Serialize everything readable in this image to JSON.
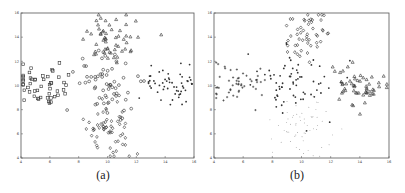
{
  "figure": {
    "captions": [
      "(a)",
      "(b)"
    ]
  },
  "chart_data": [
    {
      "type": "scatter",
      "title": "",
      "caption": "(a)",
      "xlabel": "",
      "ylabel": "",
      "xlim": [
        4,
        16
      ],
      "ylim": [
        4,
        16
      ],
      "xticks": [
        4,
        6,
        8,
        10,
        12,
        14,
        16
      ],
      "yticks": [
        4,
        6,
        8,
        10,
        12,
        14,
        16
      ],
      "grid": false,
      "legend": null,
      "series": [
        {
          "name": "left cluster",
          "marker": "square",
          "center": [
            5.5,
            10.0
          ],
          "spread": [
            1.3,
            1.0
          ],
          "count": 50,
          "seed": 11
        },
        {
          "name": "center cluster",
          "marker": "circle",
          "center": [
            10.0,
            10.2
          ],
          "spread": [
            1.4,
            1.1
          ],
          "count": 60,
          "seed": 23
        },
        {
          "name": "top cluster",
          "marker": "triangle",
          "center": [
            10.3,
            14.2
          ],
          "spread": [
            1.0,
            1.1
          ],
          "count": 55,
          "seed": 37
        },
        {
          "name": "bottom cluster",
          "marker": "diamond",
          "center": [
            10.0,
            6.6
          ],
          "spread": [
            1.0,
            1.3
          ],
          "count": 60,
          "seed": 41
        },
        {
          "name": "right cluster",
          "marker": "dot",
          "center": [
            14.4,
            10.0
          ],
          "spread": [
            1.0,
            0.9
          ],
          "count": 55,
          "seed": 53
        }
      ]
    },
    {
      "type": "scatter",
      "title": "",
      "caption": "(b)",
      "xlabel": "",
      "ylabel": "",
      "xlim": [
        4,
        16
      ],
      "ylim": [
        4,
        16
      ],
      "xticks": [
        4,
        6,
        8,
        10,
        12,
        14,
        16
      ],
      "yticks": [
        4,
        6,
        8,
        10,
        12,
        14,
        16
      ],
      "grid": false,
      "legend": null,
      "series": [
        {
          "name": "left cluster",
          "marker": "plus",
          "center": [
            5.5,
            10.0
          ],
          "spread": [
            1.3,
            1.0
          ],
          "count": 50,
          "seed": 11
        },
        {
          "name": "center cluster",
          "marker": "dot",
          "center": [
            10.0,
            10.4
          ],
          "spread": [
            1.5,
            1.2
          ],
          "count": 70,
          "seed": 23
        },
        {
          "name": "top cluster",
          "marker": "diamond",
          "center": [
            10.3,
            14.3
          ],
          "spread": [
            0.9,
            1.0
          ],
          "count": 50,
          "seed": 37
        },
        {
          "name": "bottom cluster",
          "marker": "tiny-dot",
          "center": [
            10.0,
            6.6
          ],
          "spread": [
            1.0,
            1.3
          ],
          "count": 60,
          "seed": 41
        },
        {
          "name": "right cluster",
          "marker": "triangle",
          "center": [
            14.3,
            10.0
          ],
          "spread": [
            1.1,
            1.0
          ],
          "count": 55,
          "seed": 53
        }
      ]
    }
  ],
  "layout": {
    "panels": [
      {
        "left": 21,
        "top": 13,
        "width": 173,
        "height": 145,
        "caption_x": 103,
        "caption_y": 168
      },
      {
        "left": 214,
        "top": 13,
        "width": 175,
        "height": 145,
        "caption_x": 297,
        "caption_y": 168
      }
    ],
    "colors": {
      "axis": "#555555",
      "marker": "#333333",
      "marker_light": "#777777"
    }
  }
}
